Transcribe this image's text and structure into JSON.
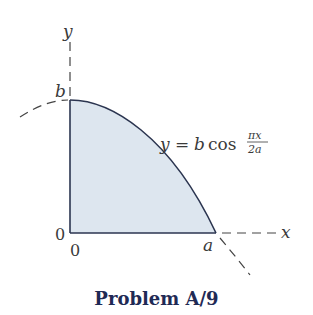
{
  "diagram": {
    "title": "Problem A/9",
    "equation": {
      "lhs": "y",
      "equals": "=",
      "coef": "b",
      "func": "cos",
      "numerator": "πx",
      "denominator": "2a"
    },
    "labels": {
      "y_axis": "y",
      "x_axis": "x",
      "b": "b",
      "a": "a",
      "origin_left": "0",
      "origin_below": "0"
    },
    "colors": {
      "fill": "#dde6ef",
      "stroke": "#2b3550",
      "title": "#1f2a55",
      "dash": "#444444"
    }
  }
}
